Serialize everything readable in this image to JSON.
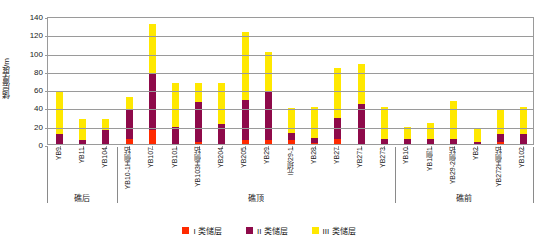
{
  "chart_data": {
    "type": "bar",
    "stacked": true,
    "title": "",
    "xlabel": "",
    "ylabel": "储层厚度/m",
    "ylim": [
      0,
      140
    ],
    "yticks": [
      0,
      20,
      40,
      60,
      80,
      100,
      120,
      140
    ],
    "grid": true,
    "legend_position": "bottom",
    "legend": [
      "I 类储层",
      "II 类储层",
      "III 类储层"
    ],
    "colors": {
      "class_I": "#ff2a00",
      "class_II": "#8e0a4a",
      "class_III": "#ffe800",
      "axis": "#9a9a9a",
      "text": "#222222",
      "background": "#ffffff"
    },
    "categories": [
      "YB9",
      "YB11",
      "YB104",
      "YB10-1H侧钻",
      "YB107",
      "YB101",
      "YB103H侧钻",
      "YB204",
      "YB205",
      "YB29",
      "元坝29-1",
      "YB28",
      "YB27",
      "YB271",
      "YB273",
      "YB10",
      "YB1侧1",
      "YB29-2侧钻",
      "YB2",
      "YB272H侧钻",
      "YB102"
    ],
    "series": [
      {
        "name": "I 类储层",
        "values": [
          0,
          0,
          0,
          6,
          15,
          0,
          2,
          0,
          4,
          4,
          4,
          1,
          5,
          0,
          0,
          0,
          0,
          0,
          0,
          2,
          0
        ]
      },
      {
        "name": "II 类储层",
        "values": [
          11,
          4,
          15,
          31,
          63,
          19,
          44,
          22,
          44,
          53,
          8,
          6,
          24,
          44,
          6,
          5,
          5,
          6,
          2,
          9,
          11
        ]
      },
      {
        "name": "III 类储层",
        "values": [
          46,
          23,
          12,
          14,
          53,
          48,
          21,
          45,
          75,
          44,
          27,
          34,
          54,
          44,
          34,
          14,
          18,
          41,
          14,
          26,
          29
        ]
      }
    ],
    "totals": [
      57,
      27,
      27,
      51,
      131,
      67,
      67,
      67,
      123,
      101,
      39,
      41,
      83,
      88,
      40,
      19,
      23,
      47,
      16,
      37,
      40
    ],
    "groups": [
      {
        "label": "礁后",
        "start_index": 0,
        "end_index": 2
      },
      {
        "label": "礁顶",
        "start_index": 3,
        "end_index": 14
      },
      {
        "label": "礁前",
        "start_index": 15,
        "end_index": 20
      }
    ]
  }
}
